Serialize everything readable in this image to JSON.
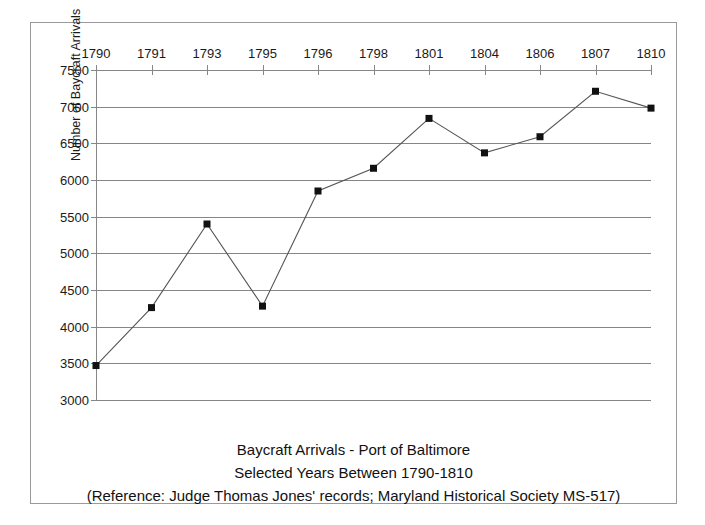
{
  "chart_data": {
    "type": "line",
    "title": "Baycraft Arrivals - Port of Baltimore",
    "subtitle": "Selected Years Between 1790-1810",
    "reference": "(Reference: Judge Thomas Jones' records; Maryland Historical Society MS-517)",
    "xlabel": "",
    "ylabel": "Number of Baycraft Arrivals",
    "categories": [
      "1790",
      "1791",
      "1793",
      "1795",
      "1796",
      "1798",
      "1801",
      "1804",
      "1806",
      "1807",
      "1810"
    ],
    "values": [
      3470,
      4260,
      5400,
      4280,
      5850,
      6160,
      6840,
      6370,
      6590,
      7210,
      6980
    ],
    "ylim": [
      3000,
      7500
    ],
    "ytick_labels": [
      "7500",
      "7000",
      "6500",
      "6000",
      "5500",
      "5000",
      "4500",
      "4000",
      "3500",
      "3000"
    ],
    "ytick_values": [
      7500,
      7000,
      6500,
      6000,
      5500,
      5000,
      4500,
      4000,
      3500,
      3000
    ],
    "grid": true,
    "legend": "none",
    "xaxis_position": "top",
    "marker": "square",
    "series_color": "#555555",
    "marker_color": "#111111",
    "grid_color": "#868686"
  }
}
